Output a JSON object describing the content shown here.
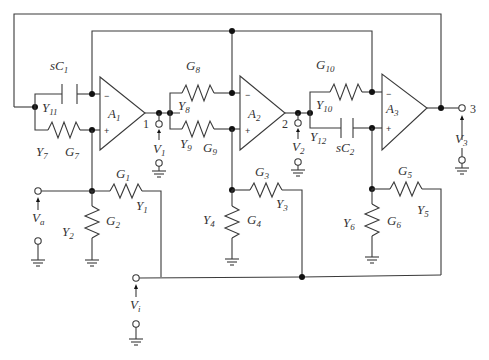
{
  "diagram": {
    "type": "active-filter-circuit",
    "opamps": [
      {
        "label": "A",
        "sub": "1"
      },
      {
        "label": "A",
        "sub": "2"
      },
      {
        "label": "A",
        "sub": "3"
      }
    ],
    "nodes": {
      "n1": "1",
      "n2": "2",
      "n3": "3"
    },
    "components": {
      "sC1": {
        "label": "sC",
        "sub": "1"
      },
      "Y11": {
        "label": "Y",
        "sub": "11"
      },
      "Y7": {
        "label": "Y",
        "sub": "7"
      },
      "G7": {
        "label": "G",
        "sub": "7"
      },
      "G8": {
        "label": "G",
        "sub": "8"
      },
      "Y8": {
        "label": "Y",
        "sub": "8"
      },
      "Y9": {
        "label": "Y",
        "sub": "9"
      },
      "G9": {
        "label": "G",
        "sub": "9"
      },
      "G10": {
        "label": "G",
        "sub": "10"
      },
      "Y10": {
        "label": "Y",
        "sub": "10"
      },
      "Y12": {
        "label": "Y",
        "sub": "12"
      },
      "sC2": {
        "label": "sC",
        "sub": "2"
      },
      "G1": {
        "label": "G",
        "sub": "1"
      },
      "Y1": {
        "label": "Y",
        "sub": "1"
      },
      "Y2": {
        "label": "Y",
        "sub": "2"
      },
      "G2": {
        "label": "G",
        "sub": "2"
      },
      "G3": {
        "label": "G",
        "sub": "3"
      },
      "Y3": {
        "label": "Y",
        "sub": "3"
      },
      "Y4": {
        "label": "Y",
        "sub": "4"
      },
      "G4": {
        "label": "G",
        "sub": "4"
      },
      "G5": {
        "label": "G",
        "sub": "5"
      },
      "Y5": {
        "label": "Y",
        "sub": "5"
      },
      "Y6": {
        "label": "Y",
        "sub": "6"
      },
      "G6": {
        "label": "G",
        "sub": "6"
      }
    },
    "voltages": {
      "V1": {
        "label": "V",
        "sub": "1"
      },
      "V2": {
        "label": "V",
        "sub": "2"
      },
      "V3": {
        "label": "V",
        "sub": "3"
      },
      "Va": {
        "label": "V",
        "sub": "a"
      },
      "Vi": {
        "label": "V",
        "sub": "i"
      }
    },
    "signs": {
      "minus": "−",
      "plus": "+"
    }
  }
}
